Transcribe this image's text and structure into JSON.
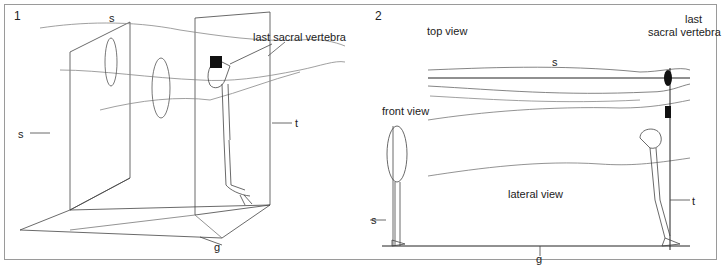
{
  "panels": [
    {
      "number": "1",
      "labels": {
        "s_top": "s",
        "s_left": "s",
        "t": "t",
        "g": "g",
        "vertebra": "last sacral vertebra"
      }
    },
    {
      "number": "2",
      "labels": {
        "top_view": "top view",
        "s_top": "s",
        "vertebra_line1": "last",
        "vertebra_line2": "sacral vertebra",
        "front_view": "front view",
        "s_left": "s",
        "lateral_view": "lateral view",
        "t": "t",
        "g": "g"
      }
    }
  ],
  "colors": {
    "line": "#444444",
    "faint_line": "#888888",
    "fill_dark": "#111111",
    "frame": "#9a9a9a"
  }
}
